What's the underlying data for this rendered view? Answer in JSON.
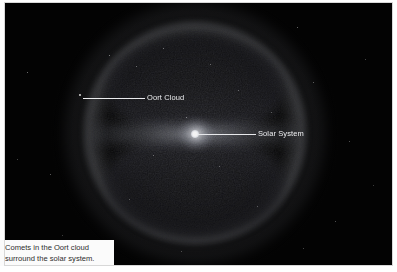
{
  "figure": {
    "title": "Comets in the Oort cloud surround the solar system.",
    "background_color": "#030303",
    "plate_border_color": "#d8d8d8"
  },
  "callouts": [
    {
      "id": "oort-cloud",
      "label": "Oort Cloud",
      "leader_color": "#f2f3f5",
      "text_color": "#f4f5f7"
    },
    {
      "id": "solar-system",
      "label": "Solar System",
      "leader_color": "#f2f3f5",
      "text_color": "#f4f5f7"
    }
  ],
  "caption": {
    "background_color": "#fbfbfb",
    "text_color": "#2d2d2d",
    "line1": "Comets in the Oort cloud",
    "line2": "surround the solar system."
  },
  "scene": {
    "description": "Spherical Oort cloud shell with two dark lobes above and below a bright equatorial disc, and a bright point marking the solar system at center.",
    "solar_system_marker_color": "#ffffff",
    "cloud_shell_color": "#c8ccd8",
    "lobe_color": "#0c0c0f"
  }
}
